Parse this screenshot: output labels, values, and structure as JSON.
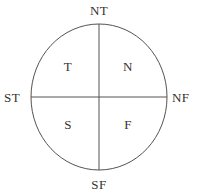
{
  "diagram": {
    "type": "quadrant-circle",
    "geometry": {
      "center_x": 99,
      "center_y": 97,
      "radius_x": 68,
      "radius_y": 73,
      "stroke_color": "#55534f",
      "stroke_width": 1,
      "background_color": "#ffffff"
    },
    "axes": {
      "vertical": {
        "from": "NT",
        "to": "SF"
      },
      "horizontal": {
        "from": "ST",
        "to": "NF"
      }
    },
    "axis_labels": {
      "north": "NT",
      "south": "SF",
      "west": "ST",
      "east": "NF"
    },
    "quadrant_labels": {
      "upper_left": "T",
      "upper_right": "N",
      "lower_left": "S",
      "lower_right": "F"
    }
  }
}
